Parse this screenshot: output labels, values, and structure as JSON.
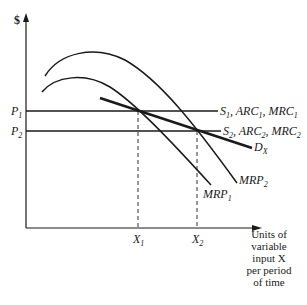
{
  "diagram": {
    "y_axis_label": "$",
    "x_axis_label_lines": [
      "Units of",
      "variable",
      "input X",
      "per period",
      "of time"
    ],
    "price_levels": [
      {
        "name": "P",
        "sub": "1"
      },
      {
        "name": "P",
        "sub": "2"
      }
    ],
    "quantity_levels": [
      {
        "name": "X",
        "sub": "1"
      },
      {
        "name": "X",
        "sub": "2"
      }
    ],
    "supply_lines": [
      {
        "label_parts": [
          {
            "t": "S",
            "s": "1"
          },
          {
            "t": ", ARC",
            "s": "1"
          },
          {
            "t": ", MRC",
            "s": "1"
          }
        ]
      },
      {
        "label_parts": [
          {
            "t": "S",
            "s": "2"
          },
          {
            "t": ", ARC",
            "s": "2"
          },
          {
            "t": ", MRC",
            "s": "2"
          }
        ]
      }
    ],
    "curves": {
      "demand": {
        "name": "D",
        "sub": "X"
      },
      "mrp1": {
        "name": "MRP",
        "sub": "1"
      },
      "mrp2": {
        "name": "MRP",
        "sub": "2"
      }
    }
  }
}
